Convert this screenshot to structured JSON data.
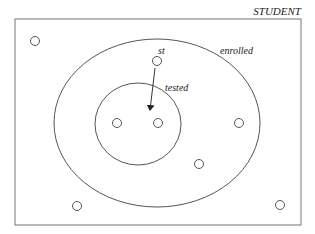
{
  "diagram": {
    "universe": {
      "label": "STUDENT",
      "rect": {
        "x": 15,
        "y": 19,
        "width": 286,
        "height": 206
      }
    },
    "sets": [
      {
        "name": "enrolled",
        "label": "enrolled",
        "cx": 157,
        "cy": 123,
        "rx": 103,
        "ry": 84,
        "label_x": 220,
        "label_y": 54
      },
      {
        "name": "tested",
        "label": "tested",
        "cx": 138,
        "cy": 124,
        "rx": 43,
        "ry": 41,
        "label_x": 165,
        "label_y": 91
      }
    ],
    "elements": [
      {
        "x": 35,
        "y": 41
      },
      {
        "x": 157,
        "y": 61,
        "label": "st"
      },
      {
        "x": 117,
        "y": 123
      },
      {
        "x": 158,
        "y": 123
      },
      {
        "x": 239,
        "y": 123
      },
      {
        "x": 199,
        "y": 164
      },
      {
        "x": 77,
        "y": 206
      },
      {
        "x": 280,
        "y": 205
      }
    ],
    "arrow": {
      "from": [
        155,
        68
      ],
      "to": [
        150,
        110
      ]
    },
    "labels": {
      "universe": "STUDENT",
      "enrolled": "enrolled",
      "tested": "tested",
      "st": "st"
    },
    "colors": {
      "stroke": "#555555",
      "text": "#222222",
      "background": "#ffffff"
    }
  }
}
